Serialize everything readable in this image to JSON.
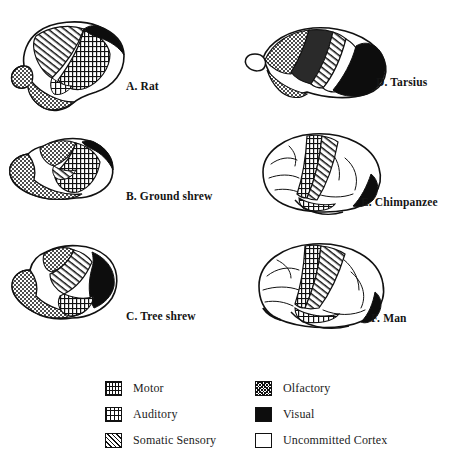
{
  "figure": {
    "title": "Uncommitted Cortex"
  },
  "plates": [
    {
      "key": "rat",
      "label": "A. Rat"
    },
    {
      "key": "groundshrew",
      "label": "B. Ground shrew"
    },
    {
      "key": "treeshrew",
      "label": "C. Tree shrew"
    },
    {
      "key": "tarsius",
      "label": "D. Tarsius"
    },
    {
      "key": "chimpanzee",
      "label": "E. Chimpanzee"
    },
    {
      "key": "man",
      "label": "F. Man"
    }
  ],
  "legend": {
    "items": [
      {
        "key": "motor",
        "label": "Motor",
        "pattern": "cross-hatch-dense",
        "color": "#111111"
      },
      {
        "key": "auditory",
        "label": "Auditory",
        "pattern": "grid-vertical",
        "color": "#111111"
      },
      {
        "key": "somatic",
        "label": "Somatic Sensory",
        "pattern": "diagonal-hatch",
        "color": "#111111"
      },
      {
        "key": "olfactory",
        "label": "Olfactory",
        "pattern": "checker-stipple",
        "color": "#111111"
      },
      {
        "key": "visual",
        "label": "Visual",
        "pattern": "solid",
        "color": "#0d0d0d"
      },
      {
        "key": "uncommitted",
        "label": "Uncommitted Cortex",
        "pattern": "outline-white",
        "color": "#ffffff"
      }
    ]
  }
}
